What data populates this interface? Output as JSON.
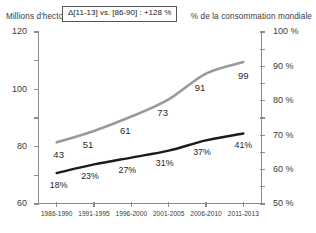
{
  "captions": {
    "left_axis": "Millions d'hectolitres",
    "right_axis": "% de la consommation mondiale"
  },
  "annotation": {
    "text": "Δ[11-13] vs. [86-90] : +128 %"
  },
  "colors": {
    "volume_line": "#9a9a9a",
    "share_line": "#1c1c1c",
    "axis": "#8d8d8d",
    "text": "#2b2b2b",
    "background": "#ffffff"
  },
  "chart_data": {
    "type": "line",
    "title": "",
    "xlabel": "",
    "ylabel": "Millions d'hectolitres",
    "y2label": "% de la consommation mondiale",
    "grid": false,
    "legend": "none",
    "categories": [
      "1986-1990",
      "1991-1995",
      "1996-2000",
      "2001-2005",
      "2006-2010",
      "2011-2013"
    ],
    "ylim": [
      0,
      120
    ],
    "yticks": [
      "0",
      "20",
      "40",
      "60",
      "80",
      "100",
      "120"
    ],
    "y2lim": [
      0,
      100
    ],
    "y2ticks": [
      "0 %",
      "10 %",
      "20 %",
      "30 %",
      "40 %",
      "50 %",
      "60 %",
      "70 %",
      "80 %",
      "90 %",
      "100 %"
    ],
    "series": [
      {
        "name": "Millions d'hectolitres",
        "axis": "left",
        "color": "#9a9a9a",
        "values": [
          43,
          51,
          61,
          73,
          91,
          99
        ],
        "labels": [
          "43",
          "51",
          "61",
          "73",
          "91",
          "99"
        ]
      },
      {
        "name": "% de la consommation mondiale",
        "axis": "right",
        "color": "#1c1c1c",
        "values": [
          18,
          23,
          27,
          31,
          37,
          41
        ],
        "labels": [
          "18%",
          "23%",
          "27%",
          "31%",
          "37%",
          "41%"
        ]
      }
    ],
    "annotations": [
      "Δ[11-13] vs. [86-90] : +128 %"
    ]
  }
}
